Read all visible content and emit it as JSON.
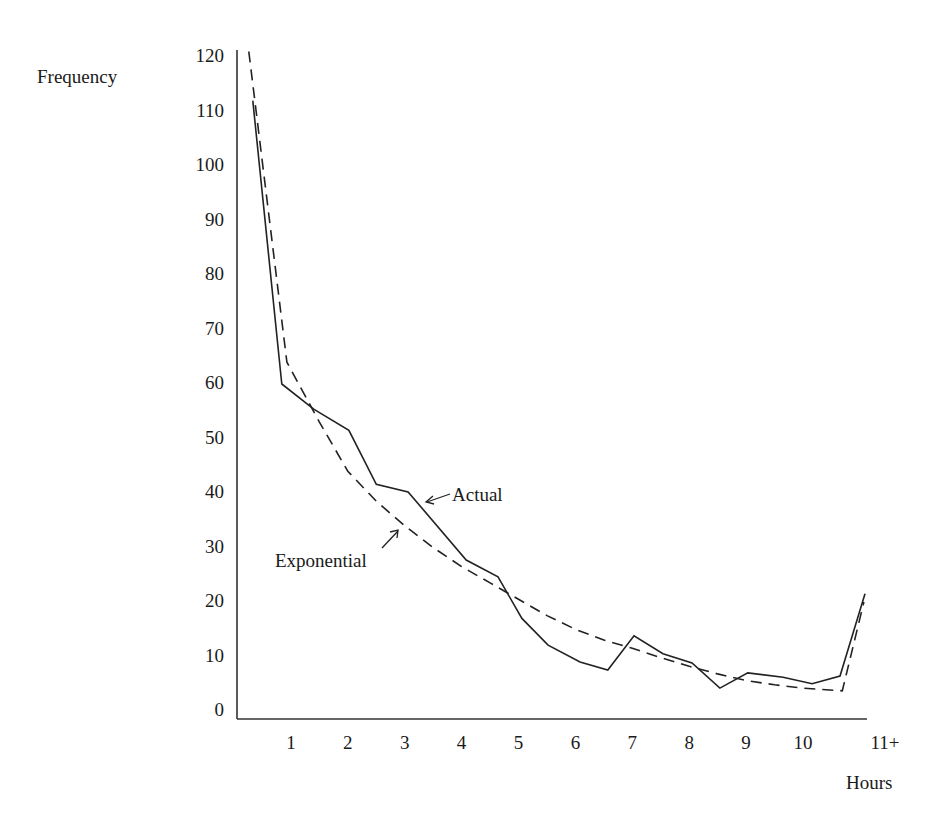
{
  "chart_data": {
    "type": "line",
    "title": "",
    "xlabel": "Hours",
    "ylabel": "Frequency",
    "xlim": [
      0,
      11.2
    ],
    "ylim": [
      0,
      120
    ],
    "grid": false,
    "legend": "inline annotations with arrows",
    "x_ticks": [
      "1",
      "2",
      "3",
      "4",
      "5",
      "6",
      "7",
      "8",
      "9",
      "10",
      "11+"
    ],
    "y_ticks": [
      "0",
      "10",
      "20",
      "30",
      "40",
      "50",
      "60",
      "70",
      "80",
      "90",
      "100",
      "110",
      "120"
    ],
    "series": [
      {
        "name": "Actual",
        "style": "solid",
        "x": [
          0.33,
          0.84,
          1.4,
          2.02,
          2.5,
          3.06,
          4.08,
          4.64,
          5.06,
          5.52,
          6.08,
          6.57,
          7.03,
          7.54,
          8.05,
          8.54,
          9.03,
          9.65,
          10.16,
          10.65,
          11.09
        ],
        "values": [
          112,
          60,
          55.4,
          51.5,
          41.6,
          40.2,
          27.7,
          24.6,
          17,
          12.1,
          9,
          7.5,
          13.8,
          10.5,
          8.8,
          4.2,
          7,
          6.2,
          5,
          6.4,
          21.5
        ]
      },
      {
        "name": "Exponential",
        "style": "dashed",
        "x": [
          0.26,
          0.93,
          1.5,
          2,
          2.5,
          3,
          3.5,
          4,
          4.5,
          5,
          5.5,
          6,
          6.5,
          7,
          7.5,
          8,
          8.5,
          9,
          9.5,
          10,
          10.69,
          11.07
        ],
        "values": [
          121,
          64,
          53,
          44,
          38.5,
          34,
          30,
          26.5,
          23.5,
          20.5,
          17.5,
          15,
          13,
          11.5,
          9.8,
          8.2,
          6.8,
          5.6,
          4.8,
          4.2,
          3.7,
          20
        ]
      }
    ],
    "annotations": [
      {
        "text": "Actual",
        "points_to": "Actual"
      },
      {
        "text": "Exponential",
        "points_to": "Exponential"
      }
    ]
  },
  "labels": {
    "ylabel": "Frequency",
    "xlabel": "Hours",
    "actual": "Actual",
    "exponential": "Exponential"
  }
}
